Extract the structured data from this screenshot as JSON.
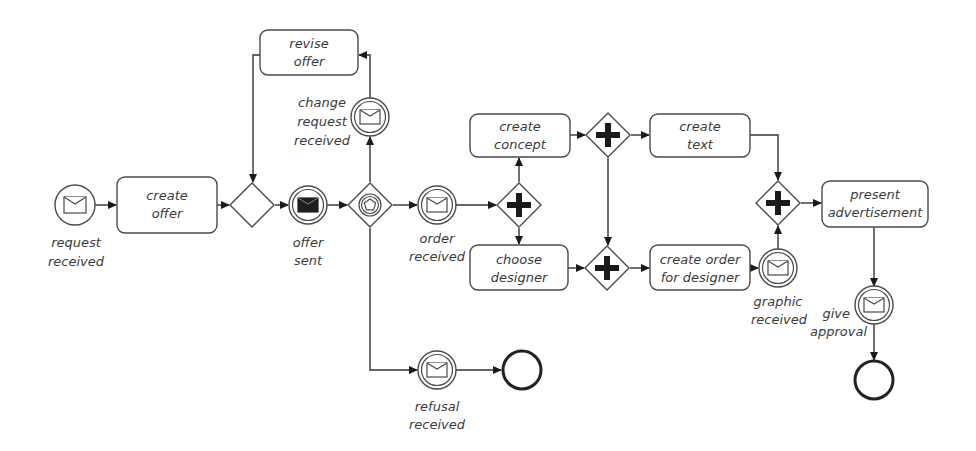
{
  "diagram": {
    "type": "BPMN process",
    "colors": {
      "stroke": "#4a4a4a",
      "text": "#3a3a3a",
      "fill": "#ffffff",
      "marker": "#1a1a1a"
    },
    "tasks": {
      "create_offer": {
        "line1": "create",
        "line2": "offer"
      },
      "revise_offer": {
        "line1": "revise",
        "line2": "offer"
      },
      "create_concept": {
        "line1": "create",
        "line2": "concept"
      },
      "choose_designer": {
        "line1": "choose",
        "line2": "designer"
      },
      "create_text": {
        "line1": "create",
        "line2": "text"
      },
      "create_order": {
        "line1": "create order",
        "line2": "for designer"
      },
      "present_ad": {
        "line1": "present",
        "line2": "advertisement"
      }
    },
    "events": {
      "request_received": {
        "type": "message-start",
        "line1": "request",
        "line2": "received"
      },
      "offer_sent": {
        "type": "message-throw-intermediate",
        "line1": "offer",
        "line2": "sent"
      },
      "change_request": {
        "type": "message-catch-intermediate",
        "line1": "change",
        "line2": "request",
        "line3": "received"
      },
      "order_received": {
        "type": "message-catch-intermediate",
        "line1": "order",
        "line2": "received"
      },
      "refusal_received": {
        "type": "message-catch-intermediate",
        "line1": "refusal",
        "line2": "received"
      },
      "graphic_received": {
        "type": "message-catch-intermediate",
        "line1": "graphic",
        "line2": "received"
      },
      "give_approval": {
        "type": "message-catch-intermediate",
        "line1": "give",
        "line2": "approval"
      },
      "end_refusal": {
        "type": "end"
      },
      "end_main": {
        "type": "end"
      }
    },
    "gateways": {
      "merge_offer": {
        "type": "exclusive"
      },
      "event_based": {
        "type": "event-based"
      },
      "split_1": {
        "type": "parallel"
      },
      "split_2": {
        "type": "parallel"
      },
      "join_1": {
        "type": "parallel"
      },
      "join_2": {
        "type": "parallel"
      }
    }
  }
}
